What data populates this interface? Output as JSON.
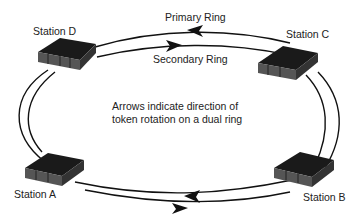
{
  "diagram": {
    "type": "dual token ring network",
    "rings": {
      "primary": {
        "label": "Primary Ring",
        "direction": "counter-clockwise (arrows point left at top)"
      },
      "secondary": {
        "label": "Secondary Ring",
        "direction": "clockwise (arrows point right at top)"
      }
    },
    "stations": [
      {
        "id": "D",
        "label": "Station D",
        "position": "top-left"
      },
      {
        "id": "C",
        "label": "Station C",
        "position": "top-right"
      },
      {
        "id": "B",
        "label": "Station B",
        "position": "bottom-right"
      },
      {
        "id": "A",
        "label": "Station A",
        "position": "bottom-left"
      }
    ],
    "note": {
      "line1": "Arrows indicate direction of",
      "line2": "token rotation on a dual ring"
    },
    "colors": {
      "line": "#111111",
      "device_top": "#1a1a1a",
      "device_front": "#555555",
      "background": "#ffffff"
    }
  }
}
